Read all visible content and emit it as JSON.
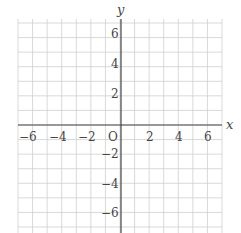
{
  "diagram": {
    "type": "coordinate-grid",
    "x_axis_label": "x",
    "y_axis_label": "y",
    "origin_label": "O",
    "x_range": [
      -7,
      7
    ],
    "y_range": [
      -7,
      7
    ],
    "grid_step": 1,
    "x_tick_labels": [
      "−6",
      "−4",
      "−2",
      "2",
      "4",
      "6"
    ],
    "y_tick_labels": [
      "6",
      "4",
      "2",
      "−2",
      "−4",
      "−6"
    ],
    "colors": {
      "grid": "#cfcfcf",
      "axis": "#444444",
      "text": "#444444"
    }
  }
}
